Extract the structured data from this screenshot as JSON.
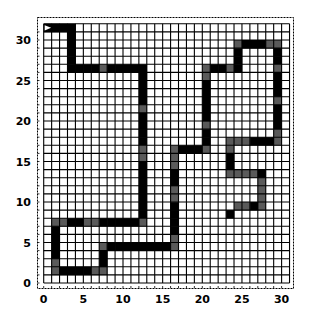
{
  "chart_data": {
    "type": "heatmap",
    "title": "",
    "xlabel": "",
    "ylabel": "",
    "grid": true,
    "grid_cols": 31,
    "grid_rows": 32,
    "xlim": [
      0,
      30
    ],
    "ylim": [
      0,
      31
    ],
    "x_ticks": [
      0,
      5,
      10,
      15,
      20,
      25,
      30
    ],
    "y_ticks": [
      0,
      5,
      10,
      15,
      20,
      25,
      30
    ],
    "start_marker": {
      "x": 0,
      "y": 31,
      "shape": "arrow-right"
    },
    "colors": {
      "path": "#000000",
      "path_alt": "#5a5a5a",
      "empty": "#ffffff",
      "grid": "#000000"
    },
    "path_vertices": [
      [
        0,
        31
      ],
      [
        3,
        31
      ],
      [
        3,
        26
      ],
      [
        12,
        26
      ],
      [
        12,
        7
      ],
      [
        1,
        7
      ],
      [
        1,
        1
      ],
      [
        7,
        1
      ],
      [
        7,
        4
      ],
      [
        16,
        4
      ],
      [
        16,
        16
      ],
      [
        20,
        16
      ],
      [
        20,
        26
      ],
      [
        24,
        26
      ],
      [
        24,
        29
      ],
      [
        29,
        29
      ],
      [
        29,
        17
      ],
      [
        23,
        17
      ],
      [
        23,
        13
      ],
      [
        27,
        13
      ],
      [
        27,
        9
      ],
      [
        24,
        9
      ],
      [
        23,
        8
      ]
    ],
    "gray_cells": [
      [
        7,
        26
      ],
      [
        12,
        21
      ],
      [
        12,
        16
      ],
      [
        12,
        15
      ],
      [
        12,
        7
      ],
      [
        1,
        7
      ],
      [
        2,
        7
      ],
      [
        5,
        7
      ],
      [
        6,
        7
      ],
      [
        1,
        2
      ],
      [
        1,
        1
      ],
      [
        6,
        1
      ],
      [
        7,
        1
      ],
      [
        7,
        4
      ],
      [
        16,
        4
      ],
      [
        16,
        5
      ],
      [
        16,
        10
      ],
      [
        16,
        11
      ],
      [
        16,
        14
      ],
      [
        16,
        15
      ],
      [
        16,
        16
      ],
      [
        20,
        16
      ],
      [
        20,
        19
      ],
      [
        20,
        25
      ],
      [
        20,
        26
      ],
      [
        23,
        26
      ],
      [
        24,
        29
      ],
      [
        28,
        29
      ],
      [
        29,
        29
      ],
      [
        29,
        26
      ],
      [
        29,
        22
      ],
      [
        29,
        18
      ],
      [
        29,
        17
      ],
      [
        23,
        17
      ],
      [
        23,
        16
      ],
      [
        24,
        13
      ],
      [
        25,
        13
      ],
      [
        26,
        13
      ],
      [
        27,
        12
      ],
      [
        27,
        11
      ],
      [
        27,
        10
      ],
      [
        27,
        9
      ],
      [
        24,
        9
      ],
      [
        25,
        9
      ],
      [
        23,
        13
      ],
      [
        24,
        17
      ],
      [
        25,
        17
      ]
    ]
  }
}
